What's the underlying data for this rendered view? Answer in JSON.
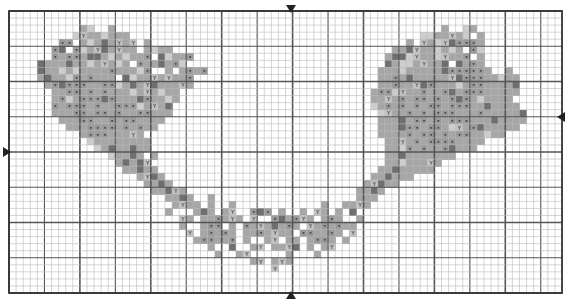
{
  "chart_data": {
    "type": "heatmap",
    "title": "",
    "grid": {
      "cols": 78,
      "rows": 40,
      "cell_w": 7.09,
      "cell_h": 7.05,
      "origin_x": 9,
      "origin_y": 11,
      "minor_line_color": "#b8b8b8",
      "major_every": 5,
      "major_line_color": "#555555",
      "border_color": "#333333"
    },
    "center_markers": {
      "top": {
        "col": 39,
        "label": "▼"
      },
      "bottom": {
        "col": 39,
        "label": "▲"
      },
      "left": {
        "row": 20,
        "label": "►"
      },
      "right": {
        "row": 15,
        "label": "◄"
      }
    },
    "legend": [
      {
        "key": "1",
        "color": "#cdcdcd",
        "symbol": ""
      },
      {
        "key": "2",
        "color": "#a6a6a6",
        "symbol": ""
      },
      {
        "key": "3",
        "color": "#6f6f6f",
        "symbol": ""
      },
      {
        "key": "Y",
        "color": "#c4c4c4",
        "symbol": "Y"
      },
      {
        "key": "o",
        "color": "#9a9a9a",
        "symbol": "•"
      }
    ],
    "rows": [
      "..............................................................................",
      "..............................................................................",
      "..........21..2..............................................2..12...........",
      ".........1Y221222.........................................1122Y21.2...........",
      ".......oo.21232Y2Y.2....................................2.Y21Y3Ooo2...........",
      "......o3.o12Y32Y22.2122...............................223Y221212.o1...........",
      "......o2oo233212122o.3122o...........................2331Y221Y22o.2..........",
      "....322232212Y212.o2232o1............................32112Y223.32o2..........",
      "....3221212222o2221o..2.2o2o........................2221222223ooooo2..2......",
      "....23221o2o222.3122Y2Y22o..........................22o2322222Y3ooo22122.....",
      ".....2o3ooo22oo1232Y3222Y2..........................22o22Y3o22212oo22223.....",
      "......22oo2o2o22212Y2122...........................2oo1Y22o22o32ooo22222.....",
      "......2o12ooo3o2223o2212...........................22Y2o2oo2o2o3o212222......",
      "......o2ooo2o22ooo12Y23............................12o2o2o2oo2ooo2232222.....",
      "......222oo2oo2o22oo222.............................1Y22o2o2ooo222o222223....",
      ".......222oo22o2oo2222..............................22232oo2o2ooo22232222....",
      "........222oooo2o2o22...............................2223oo2oo21Y2o322222.....",
      "..........2ooo222Y2.................................2222o2oo2o2oo22122.......",
      "...........122222222.................................22Y2o2oooo2222..........",
      "............12322322.................................221o2o22o3222...........",
      "..............12232.2................................2232222222..............",
      "...............2323Y.................................221222Y2................",
      "................22322...............................22322222.................",
      "..................2Y32.............................223222....................",
      "...................2232...........................2Y322......................",
      "....................223Y2........................2232.......................",
      "......................2232..2....................222........................",
      ".......................2Y22.2..2............2..22Y2..........................",
      "......................2...232.2Y..o3o.2..2.Y2.2.3...........................",
      "........................Y2.22o2Y2.Y..o32oY2.2o2..2..........................",
      "........................2..2oo.2.o2Y232o2.Y2o2o22...........................",
      ".........................Y.2o2o2.22o2Y22.oo22o2.Y...........................",
      "..........................2oo22o.2..2Y.22.2oo2.2............................",
      "............................2..3..2Y.22Y3.2.2Y.............................",
      ".............................2..2Y.....2...2................................",
      "..................................2Y.2Y2....................................",
      ".....................................Y.......................................",
      "..............................................................................",
      "..............................................................................",
      ".............................................................................."
    ]
  }
}
